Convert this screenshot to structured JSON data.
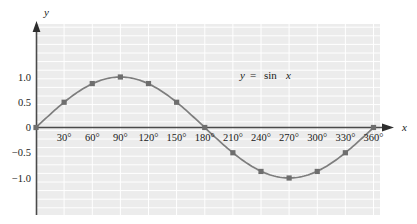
{
  "figure": {
    "axis_x_label": "x",
    "axis_y_label": "y",
    "equation_label": "y = sin x",
    "equation_parts": {
      "lhs": "y",
      "equals": "=",
      "fn": "sin",
      "arg": "x"
    },
    "colors": {
      "plot_background": "#ececec",
      "grid_line": "#ffffff",
      "curve": "#7d7d7d",
      "marker": "#6e6e6e",
      "axis": "#4a4a4a",
      "text": "#1a1a1a",
      "page_background": "#ffffff"
    }
  },
  "chart_data": {
    "type": "line",
    "title": "",
    "subtitle": "",
    "xlabel": "x",
    "ylabel": "y",
    "annotations": [
      "y = sin x"
    ],
    "grid": true,
    "legend": "none",
    "xlim": [
      0,
      360
    ],
    "ylim": [
      -1.2,
      1.2
    ],
    "x_tick_labels": [
      "30°",
      "60°",
      "90°",
      "120°",
      "150°",
      "180°",
      "210°",
      "240°",
      "270°",
      "300°",
      "330°",
      "360°"
    ],
    "x_tick_values": [
      30,
      60,
      90,
      120,
      150,
      180,
      210,
      240,
      270,
      300,
      330,
      360
    ],
    "y_tick_labels": [
      "1.0",
      "0.5",
      "0",
      "−0.5",
      "−1.0"
    ],
    "y_tick_values": [
      1.0,
      0.5,
      0,
      -0.5,
      -1.0
    ],
    "series": [
      {
        "name": "y = sin x",
        "x": [
          0,
          30,
          60,
          90,
          120,
          150,
          180,
          210,
          240,
          270,
          300,
          330,
          360
        ],
        "values": [
          0,
          0.5,
          0.87,
          1.0,
          0.87,
          0.5,
          0,
          -0.5,
          -0.87,
          -1.0,
          -0.87,
          -0.5,
          0
        ],
        "marker": "square"
      }
    ]
  }
}
